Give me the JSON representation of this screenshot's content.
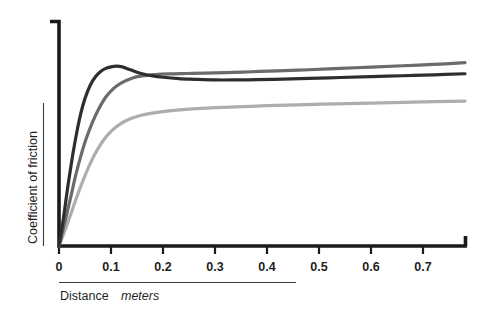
{
  "chart_data": {
    "type": "line",
    "title": "",
    "subtitle": "",
    "xlabel_main": "Distance",
    "xlabel_unit": "meters",
    "ylabel": "Coefficient of friction",
    "xlim": [
      0,
      0.78
    ],
    "ylim": [
      0,
      1.0
    ],
    "grid": false,
    "legend": "none",
    "xticks": [
      0,
      0.1,
      0.2,
      0.3,
      0.4,
      0.5,
      0.6,
      0.7
    ],
    "xticklabels": [
      "0",
      "0.1",
      "0.2",
      "0.3",
      "0.4",
      "0.5",
      "0.6",
      "0.7"
    ],
    "yticks": [],
    "yticklabels": [],
    "annotations": [],
    "series": [
      {
        "name": "dark-curve",
        "color": "#2e2e2e",
        "description": "steep rise with static-friction overshoot peak near 0.11 m then settles",
        "x": [
          0.0,
          0.005,
          0.01,
          0.018,
          0.026,
          0.034,
          0.042,
          0.05,
          0.06,
          0.07,
          0.08,
          0.09,
          0.1,
          0.11,
          0.12,
          0.13,
          0.145,
          0.16,
          0.18,
          0.2,
          0.23,
          0.26,
          0.3,
          0.34,
          0.38,
          0.43,
          0.48,
          0.54,
          0.6,
          0.66,
          0.72,
          0.78
        ],
        "y": [
          0.0,
          0.07,
          0.15,
          0.285,
          0.405,
          0.51,
          0.598,
          0.665,
          0.724,
          0.762,
          0.786,
          0.8,
          0.807,
          0.81,
          0.808,
          0.8,
          0.787,
          0.776,
          0.766,
          0.76,
          0.754,
          0.751,
          0.748,
          0.748,
          0.749,
          0.752,
          0.755,
          0.759,
          0.763,
          0.767,
          0.771,
          0.776
        ]
      },
      {
        "name": "medium-gray-curve",
        "color": "#6b6b6b",
        "description": "slightly slower rise, monotonic approach to plateau, crosses above dark curve",
        "x": [
          0.0,
          0.006,
          0.013,
          0.022,
          0.032,
          0.042,
          0.052,
          0.064,
          0.076,
          0.09,
          0.105,
          0.12,
          0.14,
          0.16,
          0.185,
          0.21,
          0.245,
          0.28,
          0.32,
          0.37,
          0.42,
          0.48,
          0.54,
          0.6,
          0.66,
          0.72,
          0.78
        ],
        "y": [
          0.0,
          0.058,
          0.124,
          0.215,
          0.318,
          0.406,
          0.482,
          0.556,
          0.616,
          0.671,
          0.71,
          0.735,
          0.756,
          0.766,
          0.772,
          0.775,
          0.777,
          0.779,
          0.781,
          0.785,
          0.789,
          0.794,
          0.8,
          0.806,
          0.812,
          0.818,
          0.826
        ]
      },
      {
        "name": "light-gray-curve",
        "color": "#adadad",
        "description": "slowest rise to a markedly lower plateau",
        "x": [
          0.0,
          0.008,
          0.017,
          0.028,
          0.04,
          0.054,
          0.068,
          0.084,
          0.1,
          0.118,
          0.138,
          0.16,
          0.185,
          0.215,
          0.25,
          0.29,
          0.34,
          0.4,
          0.46,
          0.53,
          0.6,
          0.68,
          0.78
        ],
        "y": [
          0.0,
          0.048,
          0.106,
          0.18,
          0.258,
          0.34,
          0.41,
          0.472,
          0.516,
          0.55,
          0.574,
          0.59,
          0.601,
          0.61,
          0.617,
          0.622,
          0.627,
          0.632,
          0.636,
          0.64,
          0.644,
          0.648,
          0.653
        ]
      }
    ]
  },
  "axis": {
    "axis_color": "#1a1a1a",
    "rule_color": "#3b3b3b"
  }
}
